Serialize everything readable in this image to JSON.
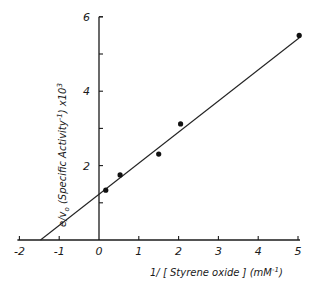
{
  "chart_data": {
    "type": "scatter",
    "title": "",
    "xlabel": "1/ [Styrene oxide] (mM⁻¹)",
    "xlabel_parts": {
      "main": "1/ [ Styrene oxide ] (mM",
      "sup": "-1",
      "end": ")"
    },
    "ylabel": "e/v₀ (Specific Activity⁻¹) x10³",
    "ylabel_parts": {
      "a": "e/v",
      "sub": "o",
      "b": " (Specific Activity",
      "sup1": "-1",
      "c": ") x10",
      "sup2": "3"
    },
    "xlim": [
      -2,
      5.2
    ],
    "ylim": [
      0,
      6
    ],
    "x_ticks": [
      -2,
      -1,
      0,
      1,
      2,
      3,
      4,
      5
    ],
    "x_tick_labels": [
      "-2",
      "-1",
      "0",
      "1",
      "2",
      "3",
      "4",
      "5"
    ],
    "y_ticks": [
      1,
      2,
      3,
      4,
      5,
      6
    ],
    "y_tick_labels": {
      "2": "2",
      "4": "4",
      "6": "6"
    },
    "grid": false,
    "legend": null,
    "series": [
      {
        "name": "data",
        "type": "scatter",
        "points": [
          {
            "x": 0.17,
            "y": 1.34
          },
          {
            "x": 0.53,
            "y": 1.75
          },
          {
            "x": 1.5,
            "y": 2.31
          },
          {
            "x": 2.05,
            "y": 3.12
          },
          {
            "x": 5.03,
            "y": 5.5
          }
        ]
      },
      {
        "name": "linear fit",
        "type": "line",
        "points": [
          {
            "x": -1.47,
            "y": 0.0
          },
          {
            "x": 5.05,
            "y": 5.45
          }
        ],
        "x_intercept": -1.47,
        "y_intercept": 1.24
      }
    ]
  }
}
